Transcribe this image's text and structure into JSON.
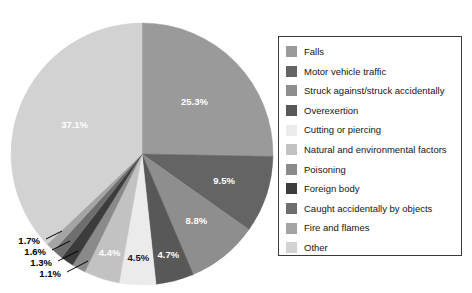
{
  "chart_data": {
    "type": "pie",
    "title": "",
    "subtitle": "",
    "xlabel": "",
    "ylabel": "",
    "legend_position": "right",
    "grid": false,
    "units": "percent",
    "start_angle_deg": 0,
    "direction": "clockwise",
    "categories": [
      "Falls",
      "Motor vehicle traffic",
      "Struck against/struck accidentally",
      "Overexertion",
      "Cutting or piercing",
      "Natural and environmental factors",
      "Poisoning",
      "Foreign body",
      "Caught accidentally by objects",
      "Fire and flames",
      "Other"
    ],
    "values": [
      25.3,
      9.5,
      8.8,
      4.7,
      4.5,
      4.4,
      1.7,
      1.6,
      1.3,
      1.1,
      37.1
    ],
    "labels": [
      "25.3%",
      "9.5%",
      "8.8%",
      "4.7%",
      "4.5%",
      "4.4%",
      "1.7%",
      "1.6%",
      "1.3%",
      "1.1%",
      "37.1%"
    ],
    "colors": [
      "#9a9a9a",
      "#646464",
      "#8e8e8e",
      "#585858",
      "#ebebeb",
      "#c2c2c2",
      "#8a8a8a",
      "#3c3c3c",
      "#6e6e6e",
      "#a4a4a4",
      "#d2d2d2"
    ],
    "label_text_colors": [
      "light",
      "light",
      "light",
      "light",
      "dark",
      "light",
      "dark",
      "dark",
      "dark",
      "dark",
      "light"
    ],
    "callout_slices": [
      "Poisoning",
      "Foreign body",
      "Caught accidentally by objects",
      "Fire and flames"
    ],
    "callout_labels": [
      "1.7%",
      "1.6%",
      "1.3%",
      "1.1%"
    ]
  },
  "legend": {
    "items": [
      {
        "label": "Falls",
        "color": "#9a9a9a"
      },
      {
        "label": "Motor vehicle traffic",
        "color": "#646464"
      },
      {
        "label": "Struck against/struck accidentally",
        "color": "#8e8e8e"
      },
      {
        "label": "Overexertion",
        "color": "#585858"
      },
      {
        "label": "Cutting or piercing",
        "color": "#ebebeb"
      },
      {
        "label": "Natural and environmental factors",
        "color": "#c2c2c2"
      },
      {
        "label": "Poisoning",
        "color": "#8a8a8a"
      },
      {
        "label": "Foreign body",
        "color": "#3c3c3c"
      },
      {
        "label": "Caught accidentally by objects",
        "color": "#6e6e6e"
      },
      {
        "label": "Fire and flames",
        "color": "#a4a4a4"
      },
      {
        "label": "Other",
        "color": "#d2d2d2"
      }
    ]
  },
  "pie_geometry": {
    "cx": 142,
    "cy": 154,
    "r": 131
  }
}
